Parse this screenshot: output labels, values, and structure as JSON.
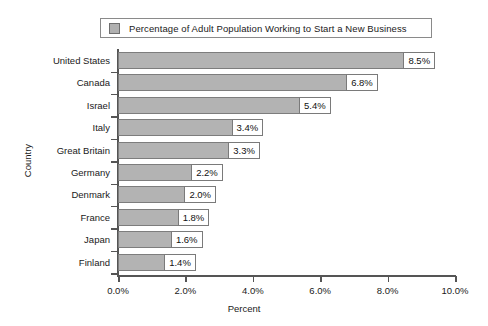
{
  "legend": {
    "swatch_name": "series-color-swatch",
    "swatch_color": "#b3b3b3",
    "label": "Percentage of Adult Population Working to Start a New Business"
  },
  "axes": {
    "x_title": "Percent",
    "y_title": "Country",
    "x_ticks": [
      "0.0%",
      "2.0%",
      "4.0%",
      "6.0%",
      "8.0%",
      "10.0%"
    ]
  },
  "chart_data": {
    "type": "bar",
    "orientation": "horizontal",
    "title": "",
    "subtitle": "",
    "xlabel": "Percent",
    "ylabel": "Country",
    "xlim": [
      0,
      10
    ],
    "xtick_values": [
      0,
      2,
      4,
      6,
      8,
      10
    ],
    "xtick_labels": [
      "0.0%",
      "2.0%",
      "4.0%",
      "6.0%",
      "8.0%",
      "10.0%"
    ],
    "grid": false,
    "legend_position": "top",
    "series": [
      {
        "name": "Percentage of Adult Population Working to Start a New Business",
        "color": "#b3b3b3",
        "values": [
          8.5,
          6.8,
          5.4,
          3.4,
          3.3,
          2.2,
          2.0,
          1.8,
          1.6,
          1.4
        ]
      }
    ],
    "categories": [
      "United States",
      "Canada",
      "Israel",
      "Italy",
      "Great Britain",
      "Germany",
      "Denmark",
      "France",
      "Japan",
      "Finland"
    ],
    "data_labels": [
      "8.5%",
      "6.8%",
      "5.4%",
      "3.4%",
      "3.3%",
      "2.2%",
      "2.0%",
      "1.8%",
      "1.6%",
      "1.4%"
    ]
  }
}
